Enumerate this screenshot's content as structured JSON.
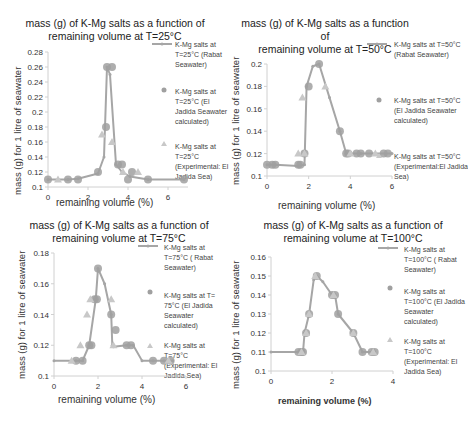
{
  "colors": {
    "line": "#a6a6a6",
    "marker_circle": "#a0a0a0",
    "marker_triangle": "#c8c8c8",
    "axis": "#d0d0d0"
  },
  "chart_data": [
    {
      "type": "line",
      "title": "mass (g) of K-Mg salts as a function of remaining volume at T=25°C",
      "xlabel": "remaining volume (%)",
      "ylabel": "mass (g) for 1 litre of seawater",
      "xlim": [
        0,
        7
      ],
      "ylim": [
        0.1,
        0.28
      ],
      "xticks": [
        "0",
        "2",
        "4",
        "6"
      ],
      "yticks": [
        "0.1",
        "0.12",
        "0.14",
        "0.16",
        "0.18",
        "0.2",
        "0.22",
        "0.24",
        "0.26",
        "0.28"
      ],
      "legend_position": "right",
      "series": [
        {
          "name": "K-Mg salts at T=25°C (Rabat Seawater)",
          "kind": "line",
          "x": [
            0,
            1,
            1.5,
            2.5,
            2.8,
            2.95,
            3.1,
            3.4,
            3.7,
            4.1,
            5,
            6.8
          ],
          "y": [
            0.11,
            0.11,
            0.111,
            0.118,
            0.14,
            0.26,
            0.25,
            0.13,
            0.12,
            0.114,
            0.11,
            0.11
          ]
        },
        {
          "name": "K-Mg salts at T=25°C (El Jadida Seawater calculated)",
          "kind": "circle",
          "x": [
            0,
            1,
            1.5,
            2.5,
            2.9,
            2.95,
            3.2,
            3.5,
            3.7,
            4,
            4.2,
            5,
            6.8
          ],
          "y": [
            0.11,
            0.11,
            0.11,
            0.12,
            0.18,
            0.26,
            0.26,
            0.13,
            0.13,
            0.11,
            0.12,
            0.11,
            0.11
          ]
        },
        {
          "name": "K-Mg salts at T=25°C (Experimental: El Jadida Sea)",
          "kind": "triangle",
          "x": [
            0.5,
            2.7,
            3.2,
            3.75,
            4.5
          ],
          "y": [
            0.11,
            0.17,
            0.16,
            0.12,
            0.12
          ]
        }
      ]
    },
    {
      "type": "line",
      "title": "mass (g) of K-Mg salts as a function of remaining volume at T=50°C",
      "xlabel": "remaining volume (%)",
      "ylabel": "mass (g) for 1 litre of seawater",
      "xlim": [
        0,
        6
      ],
      "ylim": [
        0.1,
        0.2
      ],
      "xticks": [
        "0",
        "2",
        "4",
        "6"
      ],
      "yticks": [
        "0.1",
        "0.12",
        "0.14",
        "0.16",
        "0.18",
        "0.2"
      ],
      "legend_position": "right",
      "series": [
        {
          "name": "K-Mg salts at T=50°C (Rabat Seawater)",
          "kind": "line",
          "x": [
            0,
            0.4,
            1.5,
            1.8,
            1.9,
            2.2,
            2.5,
            3.0,
            3.5,
            3.8,
            4.5,
            6
          ],
          "y": [
            0.11,
            0.11,
            0.109,
            0.11,
            0.18,
            0.198,
            0.2,
            0.17,
            0.14,
            0.12,
            0.12,
            0.12
          ]
        },
        {
          "name": "K-Mg salts at T=50°C (El Jadida Seawater calculated)",
          "kind": "circle",
          "x": [
            0,
            0.25,
            0.4,
            1.5,
            1.6,
            1.8,
            2.0,
            2.5,
            3.5,
            3.8,
            3.9,
            4.3,
            4.5,
            4.9,
            5.6,
            5.8
          ],
          "y": [
            0.11,
            0.11,
            0.11,
            0.11,
            0.11,
            0.12,
            0.18,
            0.2,
            0.14,
            0.12,
            0.12,
            0.12,
            0.12,
            0.12,
            0.12,
            0.12
          ]
        },
        {
          "name": "K-Mg salts at T=50°C (Experimental:El Jadida Sea)",
          "kind": "triangle",
          "x": [
            1.5,
            1.7,
            1.8,
            2.8,
            4.0,
            5.2
          ],
          "y": [
            0.12,
            0.17,
            0.12,
            0.18,
            0.12,
            0.12
          ]
        }
      ]
    },
    {
      "type": "line",
      "title": "mass (g) of K-Mg salts as a function of remaining volume at T=75°C",
      "xlabel": "remaining volume (%)",
      "ylabel": "mass (g) for 1 litre of seawater",
      "xlim": [
        0,
        6
      ],
      "ylim": [
        0.1,
        0.18
      ],
      "xticks": [
        "0",
        "2",
        "4",
        "6"
      ],
      "yticks": [
        "0.1",
        "0.12",
        "0.14",
        "0.16",
        "0.18"
      ],
      "legend_position": "right",
      "series": [
        {
          "name": "K-Mg salts at T=75°C ( Rabat Seawater)",
          "kind": "line",
          "x": [
            0,
            1.0,
            1.3,
            1.6,
            1.9,
            2.0,
            2.3,
            2.6,
            2.65,
            2.7,
            3.3,
            3.6,
            4.0,
            4.5,
            5.0,
            5.4
          ],
          "y": [
            0.11,
            0.11,
            0.11,
            0.12,
            0.15,
            0.17,
            0.16,
            0.14,
            0.12,
            0.119,
            0.12,
            0.12,
            0.11,
            0.11,
            0.11,
            0.11
          ]
        },
        {
          "name": "K-Mg salts at T= 75°C (El Jadida Seawater calculated)",
          "kind": "circle",
          "x": [
            1.0,
            1.3,
            1.6,
            1.7,
            1.85,
            1.95,
            2.0,
            2.6,
            2.8,
            3.3,
            3.5,
            4.5,
            5.0,
            5.3
          ],
          "y": [
            0.11,
            0.11,
            0.12,
            0.12,
            0.15,
            0.15,
            0.17,
            0.14,
            0.13,
            0.12,
            0.12,
            0.11,
            0.11,
            0.11
          ]
        },
        {
          "name": "K-Mg salts at T=75°C (Experimental: El Jadida Sea)",
          "kind": "triangle",
          "x": [
            0.8,
            1.2,
            1.5,
            1.65,
            2.6,
            2.7,
            5.2
          ],
          "y": [
            0.11,
            0.12,
            0.14,
            0.15,
            0.15,
            0.12,
            0.11
          ]
        }
      ]
    },
    {
      "type": "line",
      "title": "mass (g) of K-Mg salts as a function of remaining volume at T=100°C",
      "xlabel": "remaining volume (%)",
      "ylabel": "mass (g) for 1 litre of seawater",
      "xlim": [
        0,
        4
      ],
      "ylim": [
        0.1,
        0.16
      ],
      "xticks": [
        "0",
        "2",
        "4"
      ],
      "yticks": [
        "0.1",
        "0.11",
        "0.12",
        "0.13",
        "0.14",
        "0.15",
        "0.16"
      ],
      "legend_position": "right",
      "series": [
        {
          "name": "K-Mg salts at T=100°C ( Rabat Seawater)",
          "kind": "line",
          "x": [
            0,
            0.9,
            1.05,
            1.1,
            1.25,
            1.4,
            1.5,
            1.7,
            2.0,
            2.1,
            2.2,
            2.7,
            3.0,
            3.3,
            3.4
          ],
          "y": [
            0.11,
            0.11,
            0.11,
            0.12,
            0.13,
            0.148,
            0.15,
            0.147,
            0.14,
            0.14,
            0.13,
            0.12,
            0.11,
            0.11,
            0.11
          ]
        },
        {
          "name": "K-Mg salts at T=100°C (El Jadida Seawater calculated)",
          "kind": "circle",
          "x": [
            0.9,
            1.0,
            1.05,
            1.15,
            1.25,
            1.5,
            2.0,
            2.1,
            2.2,
            2.7,
            3.0,
            3.3,
            3.4
          ],
          "y": [
            0.11,
            0.11,
            0.11,
            0.12,
            0.13,
            0.15,
            0.14,
            0.14,
            0.13,
            0.12,
            0.11,
            0.11,
            0.11
          ]
        },
        {
          "name": "K-Mg salts at T=100°C (Experimental: El Jadida Sea)",
          "kind": "triangle",
          "x": [
            1.0,
            1.15,
            1.25,
            1.45,
            2.05,
            2.7,
            3.35
          ],
          "y": [
            0.11,
            0.12,
            0.13,
            0.15,
            0.14,
            0.12,
            0.11
          ]
        }
      ]
    }
  ],
  "charts_text": [
    {
      "title1": "mass (g) of K-Mg salts as a function of",
      "title2": "remaining volume at T=25°C",
      "xlabel": "remaining volume (%)",
      "ylabel": "mass (g) for 1 litre of seawater",
      "legend": [
        "K-Mg salts at T=25°C (Rabat Seawater)",
        "K-Mg salts at T=25°C (El Jadida Seawater calculated)",
        "K-Mg salts at T=25°C (Experimental: El Jadida Sea)"
      ]
    },
    {
      "title1": "mass (g) of K-Mg salts as a function of",
      "title2": "remaining volume at T=50°C",
      "xlabel": "remaining volume (%)",
      "ylabel": "mass (g) for 1 litre of seawater",
      "legend": [
        "K-Mg salts at T=50°C (Rabat Seawater)",
        "K-Mg salts at T=50°C (El Jadida Seawater calculated)",
        "K-Mg salts at T=50°C (Experimental:El Jadida Sea)"
      ]
    },
    {
      "title1": "mass (g) of K-Mg salts as a function of",
      "title2": "remaining volume at T=75°C",
      "xlabel": "remaining volume (%)",
      "ylabel": "mass (g) for 1 litre of seawater",
      "legend": [
        "K-Mg salts at T=75°C ( Rabat Seawater)",
        "K-Mg salts at T= 75°C (El Jadida Seawater calculated)",
        "K-Mg salts at T=75°C (Experimental: El Jadida Sea)"
      ]
    },
    {
      "title1": "mass (g) of K-Mg salts as a function of",
      "title2": "remaining volume at T=100°C",
      "xlabel": "remaining volume (%)",
      "ylabel": "mass (g) for 1 litre of seawater",
      "legend": [
        "K-Mg salts at T=100°C ( Rabat Seawater)",
        "K-Mg salts at T=100°C (El Jadida Seawater calculated)",
        "K-Mg salts at T=100°C (Experimental: El Jadida Sea)"
      ]
    }
  ]
}
